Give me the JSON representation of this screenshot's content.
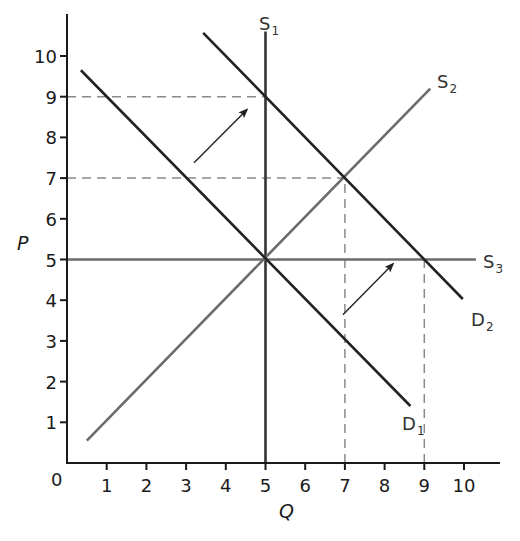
{
  "chart_data": {
    "type": "line",
    "title": "",
    "xlabel": "Q",
    "ylabel": "P",
    "origin_label": "0",
    "xlim": [
      0,
      11
    ],
    "ylim": [
      0,
      11
    ],
    "grid": false,
    "x_ticks": [
      1,
      2,
      3,
      4,
      5,
      6,
      7,
      8,
      9,
      10
    ],
    "y_ticks": [
      1,
      2,
      3,
      4,
      5,
      6,
      7,
      8,
      9,
      10
    ],
    "series": [
      {
        "name": "S1",
        "label_main": "S",
        "label_sub": "1",
        "kind": "vertical supply",
        "color": "#333333",
        "points": [
          [
            5,
            0
          ],
          [
            5,
            10.6
          ]
        ]
      },
      {
        "name": "S2",
        "label_main": "S",
        "label_sub": "2",
        "kind": "upward supply",
        "color": "#6b6b6b",
        "points": [
          [
            0.5,
            0.55
          ],
          [
            9.15,
            9.2
          ]
        ]
      },
      {
        "name": "S3",
        "label_main": "S",
        "label_sub": "3",
        "kind": "horizontal supply",
        "color": "#6b6b6b",
        "points": [
          [
            0,
            5
          ],
          [
            10.3,
            5
          ]
        ]
      },
      {
        "name": "D1",
        "label_main": "D",
        "label_sub": "1",
        "kind": "demand",
        "color": "#222222",
        "points": [
          [
            0.35,
            9.65
          ],
          [
            8.65,
            1.4
          ]
        ]
      },
      {
        "name": "D2",
        "label_main": "D",
        "label_sub": "2",
        "kind": "demand",
        "color": "#222222",
        "points": [
          [
            3.43,
            10.57
          ],
          [
            9.97,
            4.03
          ]
        ]
      }
    ],
    "reference_lines": [
      {
        "type": "horizontal-dashed",
        "y": 9,
        "x_from": 0,
        "x_to": 5
      },
      {
        "type": "horizontal-dashed",
        "y": 7,
        "x_from": 0,
        "x_to": 7
      },
      {
        "type": "vertical-dashed",
        "x": 7,
        "y_from": 0,
        "y_to": 7
      },
      {
        "type": "vertical-dashed",
        "x": 9,
        "y_from": 0,
        "y_to": 5
      }
    ],
    "annotations": [
      {
        "type": "arrow",
        "from": [
          3.2,
          7.38
        ],
        "to": [
          4.53,
          8.68
        ],
        "meaning": "demand shift D1 to D2"
      },
      {
        "type": "arrow",
        "from": [
          6.95,
          3.64
        ],
        "to": [
          8.21,
          4.89
        ],
        "meaning": "demand shift D1 to D2"
      }
    ],
    "equilibria": [
      {
        "q": 5,
        "p": 5,
        "curves": [
          "S1",
          "S2",
          "S3",
          "D1"
        ]
      },
      {
        "q": 5,
        "p": 9,
        "curves": [
          "S1",
          "D2"
        ]
      },
      {
        "q": 7,
        "p": 7,
        "curves": [
          "S2",
          "D2"
        ]
      },
      {
        "q": 9,
        "p": 5,
        "curves": [
          "S3",
          "D2"
        ]
      }
    ]
  }
}
